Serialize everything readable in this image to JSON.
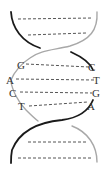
{
  "diagram": {
    "type": "dna-double-helix",
    "colors": {
      "strand_a": "#1a1a1a",
      "strand_b": "#a8a8a8",
      "rungs": "#555555",
      "labels": "#333333"
    },
    "base_pairs": [
      {
        "left": "G",
        "right": "C"
      },
      {
        "left": "A",
        "right": "T"
      },
      {
        "left": "C",
        "right": "G"
      },
      {
        "left": "T",
        "right": "A"
      }
    ],
    "unlabeled_rungs_top": 2,
    "unlabeled_rungs_bottom": 2
  }
}
